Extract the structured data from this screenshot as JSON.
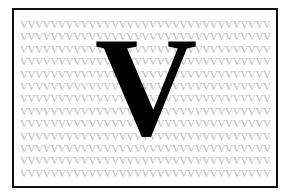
{
  "figure": {
    "background_color": "#ffffff",
    "border_color": "#111111",
    "big_letter": "V",
    "big_letter_color": "#000000",
    "pattern_color": "#b9b9b9",
    "pattern_rows": [
      "VVVVVVVVVVVVVVVVVVVVVVVVVVVVVVVVV",
      "VVVVVVVVVVVVVVVVVVVVVVVVVVVVVVVVV",
      "VVVVVVVVVVVVVVVVVVVVVVVVVVVVVVVVV",
      "VVVVVVVVVVVVVVVVVVVVVVVVVVVVVVVVV",
      "VVVVVVVVVVVVVVVVVVVVVVVVVVVVVVVVV",
      "VVVVVVVVVVVVVVVVVVVVVVVVVVVVVVVVV",
      "VVVVVVVVVVVVVVVVVVVVVVVVVVVVVVVVV",
      "VVVVVVVVVVVVVVVVVVVVVVVVVVVVVVVVV",
      "VVVVVVVVVVVVVVVVVVVVVVVVVVVVVVVVV",
      "VVVVVVVVVVVVVVVVVVVVVVVVVVVVVVVVV",
      "VVVVVVVVVVVVVVVVVVVVVVVVVVVVVVVVV",
      "VVVVVVVVVVVVVVVVVVVVVVVVVVVVVVVVV",
      "VVVVVVVVVVVVVVVVVVVVVVVVVVVVVVVVV"
    ]
  }
}
